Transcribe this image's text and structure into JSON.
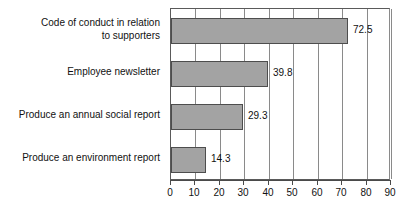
{
  "chart_data": {
    "type": "bar",
    "orientation": "horizontal",
    "title": "",
    "subtitle": "",
    "xlabel": "",
    "ylabel": "",
    "categories": [
      "Code of conduct in relation\nto supporters",
      "Employee newsletter",
      "Produce an annual social report",
      "Produce an environment report"
    ],
    "values": [
      72.5,
      39.8,
      29.3,
      14.3
    ],
    "value_labels": [
      "72.5",
      "39.8",
      "29.3",
      "14.3"
    ],
    "xlim": [
      0,
      90
    ],
    "xticks": [
      0,
      10,
      20,
      30,
      40,
      50,
      60,
      70,
      80,
      90
    ],
    "xtick_labels": [
      "0",
      "10",
      "20",
      "30",
      "40",
      "50",
      "60",
      "70",
      "80",
      "90"
    ],
    "grid": true,
    "grid_axis": "x",
    "legend": false,
    "legend_position": "none",
    "series": [
      {
        "name": "",
        "values": [
          72.5,
          39.8,
          29.3,
          14.3
        ]
      }
    ],
    "colors": {
      "bar_fill": "#a3a3a3",
      "bar_border": "#4d4d4d",
      "grid": "#8a8a8a",
      "axis": "#4a4a4a",
      "text": "#111111",
      "background": "#ffffff"
    }
  }
}
